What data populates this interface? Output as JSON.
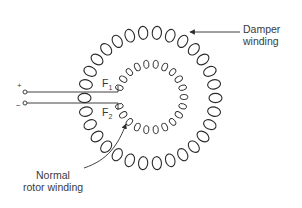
{
  "diagram": {
    "labels": {
      "damper_line1": "Damper",
      "damper_line2": "winding",
      "rotor_line1": "Normal",
      "rotor_line2": "rotor winding",
      "f1": "F",
      "f1_sub": "1",
      "f2": "F",
      "f2_sub": "2",
      "plus": "+",
      "minus": "−"
    },
    "colors": {
      "line": "#2b2b2b",
      "text": "#3a3a3a",
      "background": "#ffffff"
    },
    "outer_coil": {
      "cx": 150,
      "cy": 98,
      "r_inner": 59,
      "r_outer": 72,
      "turns": 30
    },
    "inner_coil": {
      "cx": 151,
      "cy": 97,
      "r_inner": 29,
      "r_outer": 37,
      "turns": 22
    }
  }
}
